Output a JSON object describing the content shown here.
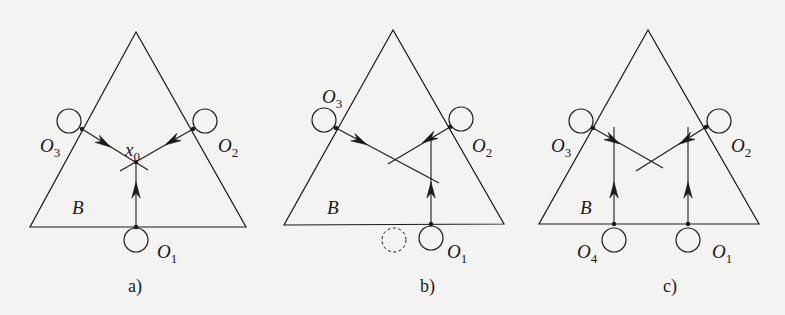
{
  "figure": {
    "background": "#f3f3f1",
    "stroke_color": "#1a1a1a",
    "panels": [
      {
        "id": "a",
        "caption": "a)",
        "caption_pos": [
          128,
          292
        ],
        "region_label": "B",
        "region_label_pos": [
          72,
          214
        ],
        "triangle": [
          [
            136,
            32
          ],
          [
            30,
            227
          ],
          [
            246,
            227
          ]
        ],
        "obstacles": [
          {
            "name": "O1",
            "label": "O",
            "sub": "1",
            "center": [
              136,
              240
            ],
            "r": 12,
            "contact": [
              136,
              227
            ],
            "label_pos": [
              157,
              258
            ],
            "dashed": false
          },
          {
            "name": "O2",
            "label": "O",
            "sub": "2",
            "center": [
              205,
              121
            ],
            "r": 12,
            "contact": [
              193,
              129
            ],
            "label_pos": [
              218,
              152
            ],
            "dashed": false
          },
          {
            "name": "O3",
            "label": "O",
            "sub": "3",
            "center": [
              69,
              121
            ],
            "r": 12,
            "contact": [
              82,
              129
            ],
            "label_pos": [
              40,
              152
            ],
            "dashed": false
          }
        ],
        "point": {
          "label": "x",
          "sub": "0",
          "pos": [
            136,
            162
          ],
          "label_pos": [
            125,
            156
          ]
        },
        "rays": [
          {
            "from": [
              82,
              129
            ],
            "to": [
              148,
              170
            ],
            "arrow_at": [
              104,
              143
            ]
          },
          {
            "from": [
              193,
              129
            ],
            "to": [
              120,
              171
            ],
            "arrow_at": [
              172,
              141
            ]
          },
          {
            "from": [
              136,
              227
            ],
            "to": [
              136,
              162
            ],
            "arrow_at": [
              136,
              190
            ]
          }
        ]
      },
      {
        "id": "b",
        "caption": "b)",
        "caption_pos": [
          420,
          292
        ],
        "region_label": "B",
        "region_label_pos": [
          327,
          214
        ],
        "triangle": [
          [
            393,
            30
          ],
          [
            284,
            225
          ],
          [
            504,
            224
          ]
        ],
        "obstacles": [
          {
            "name": "O1",
            "label": "O",
            "sub": "1",
            "center": [
              431,
              238
            ],
            "r": 12,
            "contact": [
              431,
              224
            ],
            "label_pos": [
              447,
              258
            ],
            "dashed": false
          },
          {
            "name": "O2",
            "label": "O",
            "sub": "2",
            "center": [
              461,
              119
            ],
            "r": 12,
            "contact": [
              450,
              127
            ],
            "label_pos": [
              472,
              152
            ],
            "dashed": false
          },
          {
            "name": "O3",
            "label": "O",
            "sub": "3",
            "center": [
              324,
              120
            ],
            "r": 12,
            "contact": [
              336,
              128
            ],
            "label_pos": [
              322,
              103
            ],
            "dashed": false
          },
          {
            "name": "ghost",
            "label": "",
            "sub": "",
            "center": [
              394,
              240
            ],
            "r": 12,
            "contact": null,
            "label_pos": null,
            "dashed": true
          }
        ],
        "rays": [
          {
            "from": [
              336,
              128
            ],
            "to": [
              439,
              183
            ],
            "arrow_at": [
              360,
              141
            ]
          },
          {
            "from": [
              450,
              127
            ],
            "to": [
              388,
              164
            ],
            "arrow_at": [
              429,
              139
            ]
          },
          {
            "from": [
              431,
              224
            ],
            "to": [
              431,
              140
            ],
            "arrow_at": [
              431,
              190
            ]
          }
        ]
      },
      {
        "id": "c",
        "caption": "c)",
        "caption_pos": [
          663,
          292
        ],
        "region_label": "B",
        "region_label_pos": [
          580,
          214
        ],
        "triangle": [
          [
            648,
            30
          ],
          [
            539,
            224
          ],
          [
            759,
            224
          ]
        ],
        "obstacles": [
          {
            "name": "O1",
            "label": "O",
            "sub": "1",
            "center": [
              688,
              240
            ],
            "r": 12,
            "contact": [
              688,
              224
            ],
            "label_pos": [
              712,
              258
            ],
            "dashed": false
          },
          {
            "name": "O2",
            "label": "O",
            "sub": "2",
            "center": [
              719,
              121
            ],
            "r": 12,
            "contact": [
              706,
              127
            ],
            "label_pos": [
              731,
              152
            ],
            "dashed": false
          },
          {
            "name": "O3",
            "label": "O",
            "sub": "3",
            "center": [
              581,
              121
            ],
            "r": 12,
            "contact": [
              593,
              128
            ],
            "label_pos": [
              551,
              152
            ],
            "dashed": false
          },
          {
            "name": "O4",
            "label": "O",
            "sub": "4",
            "center": [
              614,
              240
            ],
            "r": 12,
            "contact": [
              614,
              224
            ],
            "label_pos": [
              577,
              258
            ],
            "dashed": false
          }
        ],
        "rays": [
          {
            "from": [
              593,
              128
            ],
            "to": [
              663,
              168
            ],
            "arrow_at": [
              613,
              140
            ]
          },
          {
            "from": [
              706,
              127
            ],
            "to": [
              636,
              171
            ],
            "arrow_at": [
              686,
              140
            ]
          },
          {
            "from": [
              614,
              224
            ],
            "to": [
              614,
              127
            ],
            "arrow_at": [
              614,
              190
            ]
          },
          {
            "from": [
              688,
              224
            ],
            "to": [
              688,
              127
            ],
            "arrow_at": [
              688,
              190
            ]
          }
        ]
      }
    ]
  }
}
